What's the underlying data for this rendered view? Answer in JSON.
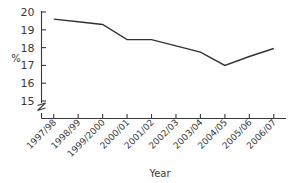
{
  "chart_data": {
    "type": "line",
    "title": "",
    "xlabel": "Year",
    "ylabel": "%",
    "categories": [
      "1997/98",
      "1998/99",
      "1999/2000",
      "2000/01",
      "2001/02",
      "2002/03",
      "2003/04",
      "2004/05",
      "2005/06",
      "2006/07"
    ],
    "values": [
      19.6,
      19.45,
      19.3,
      18.45,
      18.45,
      18.1,
      17.75,
      17.0,
      17.5,
      17.95
    ],
    "series": [
      {
        "name": "percentage",
        "values": [
          19.6,
          19.45,
          19.3,
          18.45,
          18.45,
          18.1,
          17.75,
          17.0,
          17.5,
          17.95
        ]
      }
    ],
    "ylim": [
      15,
      20
    ],
    "yticks": [
      15,
      16,
      17,
      18,
      19,
      20
    ],
    "ytick_labels": [
      "15",
      "16",
      "17",
      "18",
      "19",
      "20"
    ],
    "axis_break": true,
    "grid": false,
    "legend": "none",
    "line_color": "#333333",
    "xtick_rotation": 45
  },
  "axes": {
    "y_title": "%",
    "x_title": "Year"
  }
}
